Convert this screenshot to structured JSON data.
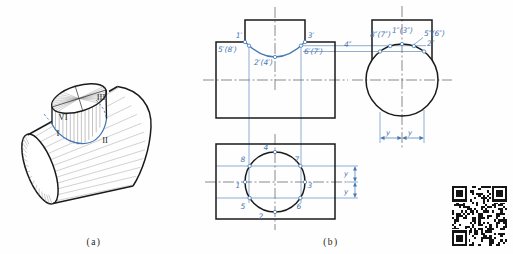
{
  "colors": {
    "ink": "#1a1a1a",
    "accent": "#4577b3"
  },
  "captions": {
    "a": "(a)",
    "b": "(b)"
  },
  "pictorial": {
    "label_1": "I",
    "label_2": "II",
    "label_3": "III",
    "label_6": "VI"
  },
  "front_view": {
    "p1": "1′",
    "p3": "3′",
    "p58": "5′(8′)",
    "p67": "6′(7′)",
    "p24": "2′(4′)"
  },
  "top_view": {
    "p1": "1",
    "p2": "2",
    "p3": "3",
    "p4": "4",
    "p5": "5",
    "p6": "6",
    "p7": "7",
    "p8": "8",
    "dim_y1": "y",
    "dim_y2": "y"
  },
  "side_view": {
    "p87": "8″(7″)",
    "p13": "1″(3″)",
    "p56": "5″(6″)",
    "p4": "4″",
    "p2": "2″",
    "dim_y1": "y",
    "dim_y2": "y"
  }
}
